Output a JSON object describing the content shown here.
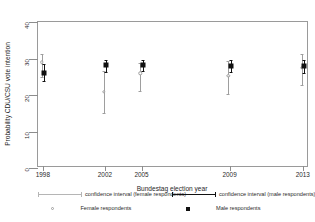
{
  "chart_data": {
    "type": "scatter",
    "title": "",
    "xlabel": "Bundestag election year",
    "ylabel": "Probability CDU/CSU vote intention",
    "categories": [
      "1998",
      "2002",
      "2005",
      "2009",
      "2013"
    ],
    "xticklabels": [
      "1998",
      "2002",
      "2005",
      "2009",
      "2013"
    ],
    "yticklabels": [
      "0",
      "10",
      "20",
      "30",
      "40"
    ],
    "yticks": [
      0,
      10,
      20,
      30,
      40
    ],
    "ylim": [
      0,
      40
    ],
    "xlim": [
      1997,
      2014
    ],
    "grid": false,
    "legend_position": "below-axes",
    "series": [
      {
        "name": "Female respondents",
        "marker": "open-circle",
        "color": "#9e9e9e",
        "values": [
          29.0,
          20.9,
          25.9,
          25.2,
          27.5
        ],
        "ci_low": [
          25.0,
          15.1,
          21.0,
          20.4,
          22.7
        ],
        "ci_high": [
          31.1,
          26.7,
          28.8,
          29.2,
          31.2
        ]
      },
      {
        "name": "Male respondents",
        "marker": "filled-square",
        "color": "#111111",
        "values": [
          26.1,
          28.1,
          28.2,
          28.0,
          27.9
        ],
        "ci_low": [
          23.9,
          26.3,
          26.6,
          26.2,
          26.0
        ],
        "ci_high": [
          28.4,
          29.6,
          29.7,
          29.6,
          29.7
        ]
      }
    ],
    "legend": [
      {
        "label": "confidence interval (female respondents)",
        "key": "line-light"
      },
      {
        "label": "confidence interval (male respondents)",
        "key": "line-dark"
      },
      {
        "label": "Female respondents",
        "key": "open-circle"
      },
      {
        "label": "Male respondents",
        "key": "filled-square"
      }
    ]
  }
}
